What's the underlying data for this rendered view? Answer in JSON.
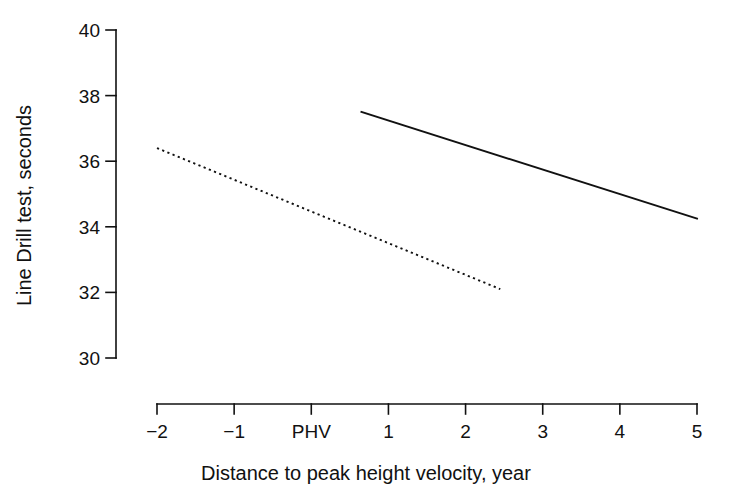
{
  "chart_data": {
    "type": "line",
    "title": "",
    "xlabel": "Distance to peak height velocity, year",
    "ylabel": "Line Drill test, seconds",
    "xlim": [
      -2,
      5
    ],
    "ylim": [
      30,
      40
    ],
    "grid": false,
    "legend_position": "none",
    "x_ticks": [
      {
        "value": -2,
        "label": "−2"
      },
      {
        "value": -1,
        "label": "−1"
      },
      {
        "value": 0,
        "label": "PHV"
      },
      {
        "value": 1,
        "label": "1"
      },
      {
        "value": 2,
        "label": "2"
      },
      {
        "value": 3,
        "label": "3"
      },
      {
        "value": 4,
        "label": "4"
      },
      {
        "value": 5,
        "label": "5"
      }
    ],
    "y_ticks": [
      {
        "value": 30,
        "label": "30"
      },
      {
        "value": 32,
        "label": "32"
      },
      {
        "value": 34,
        "label": "34"
      },
      {
        "value": 36,
        "label": "36"
      },
      {
        "value": 38,
        "label": "38"
      },
      {
        "value": 40,
        "label": "40"
      }
    ],
    "series": [
      {
        "name": "solid-line",
        "style": "solid",
        "color": "#111111",
        "x": [
          0.65,
          5.0
        ],
        "y": [
          37.5,
          34.25
        ]
      },
      {
        "name": "dotted-line",
        "style": "dotted",
        "color": "#111111",
        "x": [
          -2.0,
          2.45
        ],
        "y": [
          36.4,
          32.1
        ]
      }
    ],
    "annotations": []
  },
  "axes": {
    "x_axis_name": "x-axis",
    "y_axis_name": "y-axis"
  }
}
